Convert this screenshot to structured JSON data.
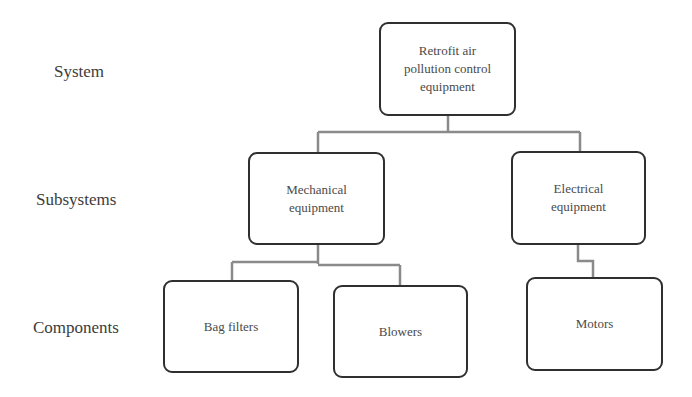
{
  "levels": {
    "system": "System",
    "subsystems": "Subsystems",
    "components": "Components"
  },
  "nodes": {
    "root": "Retrofit air pollution control equipment",
    "root_lines": [
      "Retrofit air",
      "pollution control",
      "equipment"
    ],
    "mechanical_lines": [
      "Mechanical",
      "equipment"
    ],
    "electrical_lines": [
      "Electrical",
      "equipment"
    ],
    "bag_filters": "Bag filters",
    "blowers": "Blowers",
    "motors": "Motors"
  },
  "colors": {
    "box_border": "#2f2f2f",
    "connector": "#8a8a8a",
    "text": "#4a4a4a"
  }
}
